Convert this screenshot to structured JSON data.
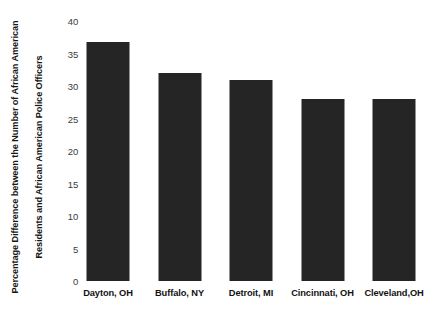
{
  "chart_data": {
    "type": "bar",
    "title": "",
    "xlabel": "",
    "ylabel": "Percentage Difference between the Number of African American Residents and African American Police Officers",
    "ylabel_lines": [
      "Percentage Difference between the Number of African American",
      "Residents and African American Police Officers"
    ],
    "categories": [
      "Dayton, OH",
      "Buffalo, NY",
      "Detroit, MI",
      "Cincinnati, OH",
      "Cleveland,OH"
    ],
    "values": [
      36.8,
      32,
      31,
      28,
      28
    ],
    "ylim": [
      0,
      40
    ],
    "ytick_labels": [
      "40",
      "35",
      "30",
      "25",
      "20",
      "15",
      "10",
      "5",
      "0"
    ],
    "ytick_values": [
      40,
      35,
      30,
      25,
      20,
      15,
      10,
      5,
      0
    ],
    "grid": false,
    "legend": false,
    "bar_color": "#252525",
    "background_color": "#ffffff",
    "tick_label_color": "#3b3b3b",
    "axis_title_color": "#161616"
  }
}
